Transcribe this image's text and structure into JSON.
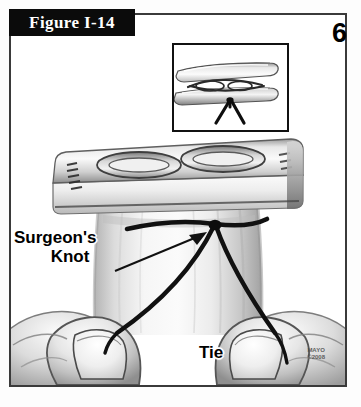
{
  "figure": {
    "banner_label": "Figure I-14",
    "step_number": "6"
  },
  "labels": {
    "surgeons_knot_line1": "Surgeon's",
    "surgeons_knot_line2": "Knot",
    "tie": "Tie"
  },
  "watermark": {
    "org": "MAYO",
    "copyright": "©2008"
  },
  "icons": {
    "inset_panel": "forceps-jaws-closeup-icon",
    "main_scene": "hands-tying-suture-icon"
  },
  "colors": {
    "banner_background": "#0b0b0b",
    "banner_text": "#ffffff",
    "border": "#3a3a3a",
    "suture": "#111111",
    "page_background": "#ffffff",
    "skin_light": "#f2f2f2",
    "skin_mid": "#c9c9c9",
    "skin_dark": "#8a8a8a",
    "metal_light": "#efefef",
    "metal_dark": "#6f6f6f"
  }
}
